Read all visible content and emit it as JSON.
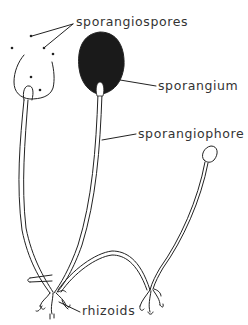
{
  "diagram": {
    "labels": {
      "sporangiospores": "sporangiospores",
      "sporangium": "sporangium",
      "sporangiophore": "sporangiophore",
      "rhizoids": "rhizoids"
    },
    "colors": {
      "line": "#222222",
      "text": "#333333",
      "background": "#ffffff",
      "sporangium_fill": "#1a1a1a"
    }
  }
}
